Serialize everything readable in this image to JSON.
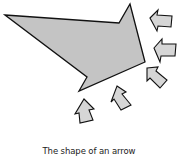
{
  "caption": "The shape of an arrow",
  "colors": {
    "fill": "#c4c4c4",
    "small_fill": "#d6d6d6",
    "stroke": "#111111",
    "background": "#ffffff"
  },
  "shapes": {
    "big_arrow": "5,15 119,23 130,4 145,62 79,91 87,77",
    "small_arrows": [
      {
        "name": "small-arrow-top-right",
        "points": "150,18 158,10 157,15 172,16 171,27 158,26 157,31"
      },
      {
        "name": "small-arrow-mid-right",
        "points": "154,48 162,39 162,44 176,44 175,56 161,56 160,62"
      },
      {
        "name": "small-arrow-lower-right",
        "points": "147,68 158,67 156,71 167,80 160,88 150,78 147,81"
      },
      {
        "name": "small-arrow-bottom-mid",
        "points": "117,86 126,92 122,94 131,105 121,110 114,99 111,102"
      },
      {
        "name": "small-arrow-bottom-left",
        "points": "84,99 94,109 89,110 93,120 80,123 79,113 75,114"
      }
    ]
  }
}
